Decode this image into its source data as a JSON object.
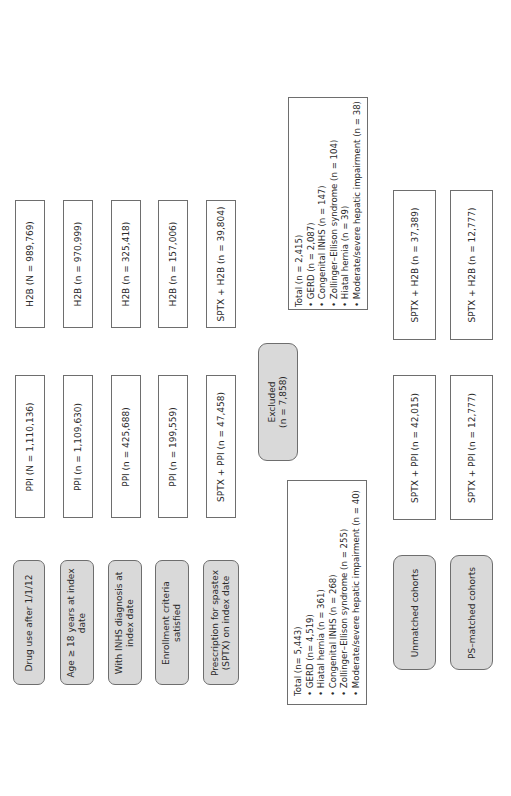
{
  "criteria": [
    {
      "label": "Drug use after 1/1/12",
      "ppi": "PPI (N = 1,110,136)",
      "h2b": "H2B (N = 989,769)"
    },
    {
      "label": "Age ≥ 18 years at index date",
      "ppi": "PPI (n = 1,109,630)",
      "h2b": "H2B (n = 970,999)"
    },
    {
      "label": "With INHS diagnosis at index date",
      "ppi": "PPI (n = 425,688)",
      "h2b": "H2B (n = 325,418)"
    },
    {
      "label": "Enrollment criteria satisfied",
      "ppi": "PPI (n = 199,559)",
      "h2b": "H2B (n = 157,006)"
    },
    {
      "label": "Prescription for spastex (SPTX) on index date",
      "ppi": "SPTX + PPI (n = 47,458)",
      "h2b": "SPTX + H2B (n = 39,804)"
    }
  ],
  "excluded": {
    "title": "Excluded",
    "count": "(n = 7,858)"
  },
  "ppi_exclusions": {
    "total": "Total (n= 5,443)",
    "items": [
      "• GERD (n= 4,519)",
      "• Hiatal hernia (n = 361)",
      "• Congenital INHS (n = 268)",
      "• Zollinger–Ellison syndrome (n =  255)",
      "• Moderate/severe hepatic impairment (n = 40)"
    ]
  },
  "h2b_exclusions": {
    "total": "Total (n = 2,415)",
    "items": [
      "• GERD (n = 2,087)",
      "• Congenital INHS (n = 147)",
      "• Zollinger–Ellison syndrome (n = 104)",
      "• Hiatal hernia (n = 39)",
      "• Moderate/severe hepatic impairment (n = 38)"
    ]
  },
  "cohorts": [
    {
      "label": "Unmatched cohorts",
      "ppi": "SPTX + PPI (n = 42,015)",
      "h2b": "SPTX + H2B (n = 37,389)"
    },
    {
      "label": "PS–matched cohorts",
      "ppi": "SPTX + PPI (n = 12,777)",
      "h2b": "SPTX + H2B (n = 12,777)"
    }
  ],
  "colors": {
    "label_box_fill": "#d9d9d9",
    "border": "#6e6e6e",
    "text": "#2a2a2a"
  }
}
